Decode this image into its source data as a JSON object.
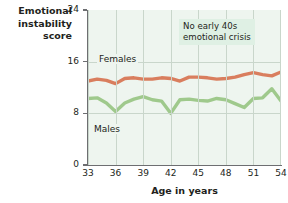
{
  "chart_data": {
    "type": "line",
    "title": "",
    "xlabel": "Age in years",
    "ylabel": "Emotional instability score",
    "ylabel_lines": [
      "Emotional",
      "instability",
      "score"
    ],
    "xlim": [
      33,
      54
    ],
    "ylim": [
      0,
      24
    ],
    "yticks": [
      0,
      8,
      16,
      24
    ],
    "xticks": [
      33,
      36,
      39,
      42,
      45,
      48,
      51,
      54
    ],
    "grid": true,
    "legend_position": "inline-labels",
    "annotations": [
      {
        "text_lines": [
          "No early 40s",
          "emotional crisis"
        ],
        "x": 45,
        "y": 21
      }
    ],
    "series": [
      {
        "name": "Females",
        "color": "#d97e5e",
        "x": [
          33,
          34,
          35,
          36,
          37,
          38,
          39,
          40,
          41,
          42,
          43,
          44,
          45,
          46,
          47,
          48,
          49,
          50,
          51,
          52,
          53,
          54
        ],
        "values": [
          13.0,
          13.3,
          13.1,
          12.6,
          13.4,
          13.5,
          13.3,
          13.3,
          13.5,
          13.4,
          13.0,
          13.6,
          13.6,
          13.5,
          13.3,
          13.4,
          13.6,
          14.0,
          14.3,
          14.0,
          13.8,
          14.4
        ]
      },
      {
        "name": "Males",
        "color": "#9fc98c",
        "x": [
          33,
          34,
          35,
          36,
          37,
          38,
          39,
          40,
          41,
          42,
          43,
          44,
          45,
          46,
          47,
          48,
          49,
          50,
          51,
          52,
          53,
          54
        ],
        "values": [
          10.3,
          10.4,
          9.6,
          8.3,
          9.6,
          10.2,
          10.6,
          10.1,
          9.9,
          8.0,
          10.1,
          10.2,
          10.0,
          9.9,
          10.3,
          10.1,
          9.5,
          8.9,
          10.3,
          10.4,
          11.8,
          9.9
        ]
      }
    ]
  },
  "labels": {
    "females": "Females",
    "males": "Males"
  },
  "colors": {
    "female_line": "#d97e5e",
    "male_line": "#9fc98c",
    "plot_background": "#eef5ef",
    "gridline": "#c9d6cb",
    "annotation_background": "#dff0e4",
    "axis": "#6d6e71"
  }
}
